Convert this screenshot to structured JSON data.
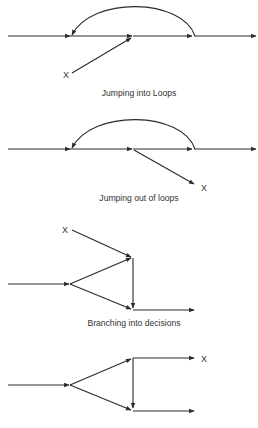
{
  "diagrams": [
    {
      "caption": "Jumping into Loops",
      "label": "X"
    },
    {
      "caption": "Jumping out of loops",
      "label": "X"
    },
    {
      "caption": "Branching into decisions",
      "label": "X"
    },
    {
      "caption": "",
      "label": "X"
    }
  ],
  "colors": {
    "line": "#2a2a2a",
    "text": "#333333",
    "background": "#ffffff"
  }
}
